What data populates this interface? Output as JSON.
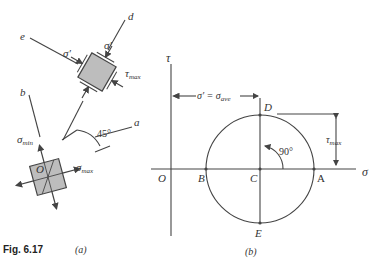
{
  "figure": {
    "caption": "Fig. 6.17",
    "part_a_label": "(a)",
    "part_b_label": "(b)"
  },
  "part_a": {
    "axis_labels": {
      "a": "a",
      "b": "b",
      "d": "d",
      "e": "e"
    },
    "origin_label": "O",
    "angle_label": "45°",
    "stress_labels": {
      "sigma_prime_1": "σ′",
      "sigma_prime_2": "σ′",
      "tau_max": "τ",
      "tau_max_sub": "max",
      "sigma_min": "σ",
      "sigma_min_sub": "min",
      "sigma_max": "σ",
      "sigma_max_sub": "max"
    }
  },
  "part_b": {
    "tau_axis_label": "τ",
    "sigma_axis_label": "σ",
    "origin_label": "O",
    "points": {
      "A": "A",
      "B": "B",
      "C": "C",
      "D": "D",
      "E": "E"
    },
    "dimension_label": "σ′ = σ",
    "dimension_sub": "ave",
    "angle_label": "90°",
    "tau_max": "τ",
    "tau_max_sub": "max",
    "colors": {
      "line": "#444444",
      "element_fill": "#bdbdbd"
    }
  }
}
